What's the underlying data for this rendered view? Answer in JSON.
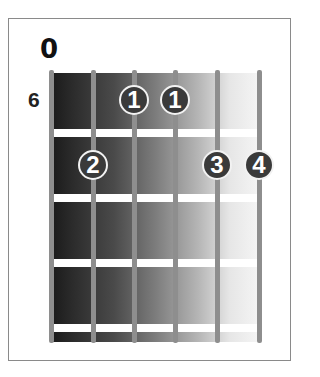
{
  "diagram": {
    "type": "guitar-chord-chart",
    "strings": 6,
    "frets_shown": 4,
    "starting_fret_label": "6",
    "open_marker": "0",
    "open_marker_string": 6,
    "fingers": [
      {
        "finger": "1",
        "string": 3,
        "fret": 1
      },
      {
        "finger": "1",
        "string": 4,
        "fret": 1
      },
      {
        "finger": "2",
        "string": 2,
        "fret": 2
      },
      {
        "finger": "3",
        "string": 5,
        "fret": 2
      },
      {
        "finger": "4",
        "string": 6,
        "fret": 2
      }
    ]
  },
  "colors": {
    "frame_border": "#8a8a8a",
    "string": "#8e8e8e",
    "fret": "#ffffff",
    "finger_fill": "#3a3a3a",
    "finger_ring": "#f2f2f2",
    "gradient_dark": "#1a1a1a",
    "gradient_light": "#f6f6f6"
  }
}
